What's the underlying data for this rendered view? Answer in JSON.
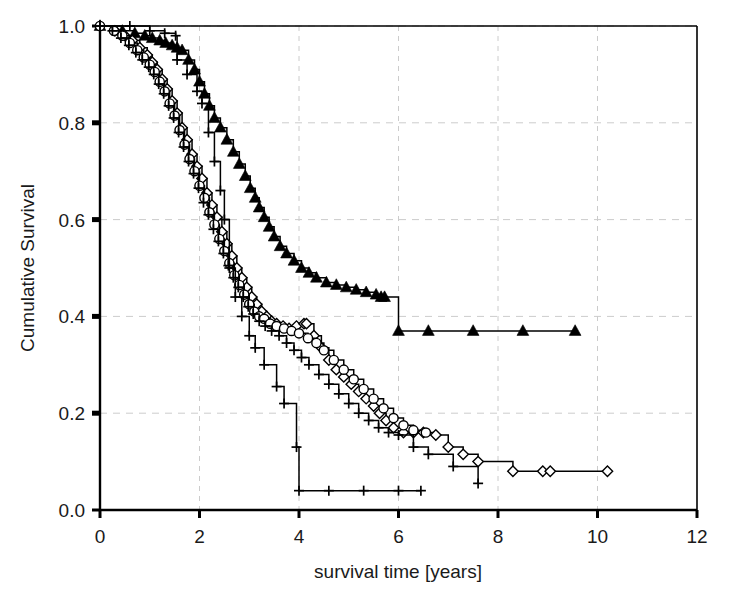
{
  "chart_data": {
    "type": "line",
    "subtype": "kaplan-meier-step",
    "title": "",
    "xlabel": "survival time [years]",
    "ylabel": "Cumulative Survival",
    "xlim": [
      0,
      12
    ],
    "ylim": [
      0.0,
      1.0
    ],
    "xticks": [
      0,
      2,
      4,
      6,
      8,
      10,
      12
    ],
    "xtick_labels": [
      "0",
      "2",
      "4",
      "6",
      "8",
      "10",
      "12"
    ],
    "yticks": [
      0.0,
      0.2,
      0.4,
      0.6,
      0.8,
      1.0
    ],
    "ytick_labels": [
      "0.0",
      "0.2",
      "0.4",
      "0.6",
      "0.8",
      "1.0"
    ],
    "grid": true,
    "grid_style": "dashed",
    "grid_color": "#cccccc",
    "legend": "none",
    "line_color": "#000000",
    "series": [
      {
        "name": "curve-triangle",
        "marker": "filled-triangle",
        "marker_filled": true,
        "censor_marks": true,
        "x": [
          0.0,
          0.45,
          0.7,
          0.9,
          1.05,
          1.2,
          1.32,
          1.45,
          1.55,
          1.65,
          1.78,
          1.9,
          2.0,
          2.1,
          2.2,
          2.3,
          2.42,
          2.55,
          2.68,
          2.8,
          2.92,
          3.02,
          3.12,
          3.2,
          3.3,
          3.4,
          3.5,
          3.62,
          3.75,
          3.9,
          4.05,
          4.2,
          4.35,
          4.55,
          4.75,
          4.95,
          5.15,
          5.35,
          5.55,
          5.65,
          5.72,
          6.0,
          6.6,
          7.5,
          8.5,
          9.55
        ],
        "y": [
          1.0,
          0.99,
          0.985,
          0.98,
          0.975,
          0.97,
          0.965,
          0.96,
          0.955,
          0.95,
          0.93,
          0.91,
          0.885,
          0.86,
          0.835,
          0.81,
          0.79,
          0.765,
          0.74,
          0.715,
          0.69,
          0.665,
          0.645,
          0.625,
          0.605,
          0.585,
          0.565,
          0.545,
          0.53,
          0.515,
          0.5,
          0.49,
          0.48,
          0.47,
          0.465,
          0.46,
          0.455,
          0.45,
          0.445,
          0.44,
          0.44,
          0.37,
          0.37,
          0.37,
          0.37,
          0.37
        ],
        "final_survival": 0.37,
        "max_followup": 9.55
      },
      {
        "name": "curve-diamond",
        "marker": "open-diamond",
        "marker_filled": false,
        "censor_marks": true,
        "x": [
          0.0,
          0.3,
          0.5,
          0.65,
          0.8,
          0.95,
          1.05,
          1.15,
          1.25,
          1.35,
          1.45,
          1.55,
          1.65,
          1.75,
          1.85,
          1.95,
          2.05,
          2.15,
          2.25,
          2.35,
          2.45,
          2.55,
          2.65,
          2.75,
          2.85,
          2.95,
          3.05,
          3.15,
          3.25,
          3.35,
          3.45,
          3.55,
          3.68,
          3.8,
          3.95,
          4.1,
          4.15,
          4.3,
          4.45,
          4.6,
          4.75,
          4.9,
          5.05,
          5.2,
          5.35,
          5.5,
          5.62,
          5.75,
          5.9,
          6.1,
          6.3,
          6.5,
          6.75,
          7.0,
          7.3,
          7.6,
          8.3,
          8.9,
          9.05,
          10.2
        ],
        "y": [
          1.0,
          0.99,
          0.98,
          0.97,
          0.955,
          0.94,
          0.925,
          0.91,
          0.89,
          0.87,
          0.845,
          0.82,
          0.79,
          0.765,
          0.735,
          0.71,
          0.685,
          0.655,
          0.63,
          0.605,
          0.575,
          0.55,
          0.525,
          0.5,
          0.48,
          0.46,
          0.44,
          0.425,
          0.41,
          0.4,
          0.39,
          0.385,
          0.38,
          0.375,
          0.38,
          0.385,
          0.385,
          0.36,
          0.335,
          0.31,
          0.29,
          0.275,
          0.26,
          0.245,
          0.23,
          0.215,
          0.2,
          0.185,
          0.17,
          0.16,
          0.16,
          0.16,
          0.155,
          0.13,
          0.115,
          0.1,
          0.08,
          0.08,
          0.08,
          0.08
        ],
        "final_survival": 0.08,
        "max_followup": 10.2
      },
      {
        "name": "curve-circle",
        "marker": "open-circle",
        "marker_filled": false,
        "censor_marks": true,
        "x": [
          0.0,
          0.28,
          0.45,
          0.6,
          0.75,
          0.88,
          1.0,
          1.1,
          1.2,
          1.3,
          1.4,
          1.5,
          1.6,
          1.7,
          1.8,
          1.9,
          2.0,
          2.1,
          2.2,
          2.3,
          2.4,
          2.5,
          2.6,
          2.7,
          2.8,
          2.9,
          3.0,
          3.1,
          3.2,
          3.3,
          3.42,
          3.55,
          3.7,
          3.85,
          4.0,
          4.18,
          4.35,
          4.5,
          4.7,
          4.9,
          5.1,
          5.3,
          5.5,
          5.7,
          5.9,
          6.1,
          6.3,
          6.55
        ],
        "y": [
          1.0,
          0.99,
          0.98,
          0.965,
          0.95,
          0.935,
          0.92,
          0.905,
          0.885,
          0.865,
          0.84,
          0.815,
          0.785,
          0.755,
          0.725,
          0.7,
          0.67,
          0.645,
          0.615,
          0.59,
          0.56,
          0.535,
          0.51,
          0.485,
          0.465,
          0.445,
          0.425,
          0.41,
          0.4,
          0.395,
          0.385,
          0.38,
          0.375,
          0.37,
          0.365,
          0.355,
          0.345,
          0.33,
          0.31,
          0.29,
          0.27,
          0.25,
          0.23,
          0.21,
          0.19,
          0.175,
          0.165,
          0.16
        ],
        "final_survival": 0.16,
        "max_followup": 6.55
      },
      {
        "name": "curve-plus",
        "marker": "plus-cross",
        "marker_filled": true,
        "censor_marks": true,
        "x": [
          0.0,
          0.25,
          0.42,
          0.58,
          0.72,
          0.85,
          0.98,
          1.08,
          1.18,
          1.28,
          1.38,
          1.48,
          1.58,
          1.68,
          1.78,
          1.88,
          1.98,
          2.08,
          2.18,
          2.28,
          2.38,
          2.48,
          2.58,
          2.68,
          2.78,
          2.88,
          2.98,
          3.08,
          3.2,
          3.32,
          3.45,
          3.6,
          3.75,
          3.9,
          4.05,
          4.2,
          4.4,
          4.6,
          4.8,
          5.0,
          5.2,
          5.4,
          5.6,
          5.8,
          6.0,
          6.3,
          6.6,
          7.1,
          7.6
        ],
        "y": [
          1.0,
          0.99,
          0.975,
          0.96,
          0.945,
          0.93,
          0.915,
          0.9,
          0.88,
          0.86,
          0.835,
          0.81,
          0.78,
          0.75,
          0.72,
          0.695,
          0.665,
          0.635,
          0.61,
          0.58,
          0.555,
          0.53,
          0.505,
          0.48,
          0.46,
          0.44,
          0.42,
          0.405,
          0.39,
          0.38,
          0.37,
          0.36,
          0.345,
          0.33,
          0.315,
          0.3,
          0.28,
          0.26,
          0.24,
          0.22,
          0.2,
          0.185,
          0.17,
          0.16,
          0.155,
          0.13,
          0.115,
          0.09,
          0.055
        ],
        "final_survival": 0.055,
        "max_followup": 7.6
      },
      {
        "name": "curve-steep-plain",
        "marker": "plus-cross",
        "marker_filled": true,
        "censor_marks": true,
        "x": [
          0.0,
          0.6,
          1.0,
          1.3,
          1.52,
          1.55,
          1.75,
          1.95,
          2.05,
          2.18,
          2.3,
          2.42,
          2.5,
          2.6,
          2.72,
          2.85,
          3.0,
          3.12,
          3.3,
          3.55,
          3.7,
          3.95,
          4.0,
          4.6,
          5.3,
          6.0,
          6.45
        ],
        "y": [
          1.0,
          1.0,
          0.99,
          0.985,
          0.98,
          0.93,
          0.9,
          0.865,
          0.84,
          0.78,
          0.72,
          0.66,
          0.6,
          0.5,
          0.44,
          0.4,
          0.36,
          0.335,
          0.3,
          0.255,
          0.22,
          0.13,
          0.04,
          0.04,
          0.04,
          0.04,
          0.04
        ],
        "final_survival": 0.04,
        "max_followup": 6.45
      }
    ]
  },
  "figure": {
    "background_color": "#ffffff",
    "axis_color": "#000000",
    "plot_left_px": 100,
    "plot_right_px": 697,
    "plot_top_px": 26,
    "plot_bottom_px": 510
  }
}
